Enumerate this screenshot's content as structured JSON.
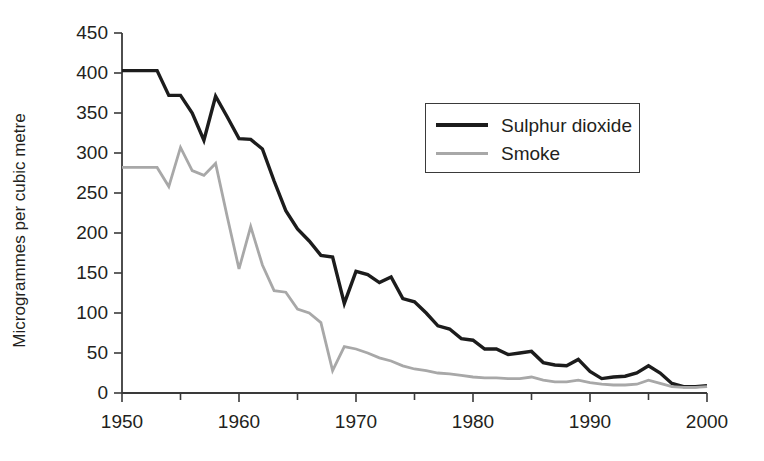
{
  "chart_data": {
    "type": "line",
    "title": "",
    "xlabel": "",
    "ylabel": "Microgrammes per cubic metre",
    "xlim": [
      1950,
      2000
    ],
    "ylim": [
      0,
      450
    ],
    "ytick_step": 50,
    "xtick_step": 10,
    "x_minor_step": 5,
    "grid": false,
    "legend_position": "upper-right-inside",
    "ytick_labels": [
      "0",
      "50",
      "100",
      "150",
      "200",
      "250",
      "300",
      "350",
      "400",
      "450"
    ],
    "ytick_values": [
      0,
      50,
      100,
      150,
      200,
      250,
      300,
      350,
      400,
      450
    ],
    "xtick_labels": [
      "1950",
      "1960",
      "1970",
      "1980",
      "1990",
      "2000"
    ],
    "xtick_values": [
      1950,
      1960,
      1970,
      1980,
      1990,
      2000
    ],
    "x": [
      1950,
      1951,
      1952,
      1953,
      1954,
      1955,
      1956,
      1957,
      1958,
      1959,
      1960,
      1961,
      1962,
      1963,
      1964,
      1965,
      1966,
      1967,
      1968,
      1969,
      1970,
      1971,
      1972,
      1973,
      1974,
      1975,
      1976,
      1977,
      1978,
      1979,
      1980,
      1981,
      1982,
      1983,
      1984,
      1985,
      1986,
      1987,
      1988,
      1989,
      1990,
      1991,
      1992,
      1993,
      1994,
      1995,
      1996,
      1997,
      1998,
      1999,
      2000
    ],
    "series": [
      {
        "name": "Sulphur dioxide",
        "color": "#1c1c1c",
        "linewidth": 3.4,
        "values": [
          403,
          403,
          403,
          403,
          372,
          372,
          350,
          316,
          371,
          345,
          318,
          317,
          305,
          265,
          228,
          205,
          190,
          172,
          170,
          112,
          152,
          148,
          138,
          145,
          118,
          114,
          100,
          84,
          80,
          68,
          66,
          55,
          55,
          48,
          50,
          52,
          38,
          35,
          34,
          42,
          27,
          18,
          20,
          21,
          25,
          34,
          25,
          12,
          8,
          8,
          9
        ]
      },
      {
        "name": "Smoke",
        "color": "#a8a8a8",
        "linewidth": 2.8,
        "values": [
          282,
          282,
          282,
          282,
          258,
          307,
          278,
          272,
          287,
          220,
          155,
          208,
          160,
          128,
          126,
          105,
          100,
          88,
          28,
          58,
          55,
          50,
          44,
          40,
          34,
          30,
          28,
          25,
          24,
          22,
          20,
          19,
          19,
          18,
          18,
          20,
          16,
          14,
          14,
          16,
          13,
          11,
          10,
          10,
          11,
          16,
          12,
          8,
          7,
          7,
          8
        ]
      }
    ]
  },
  "legend": {
    "items": [
      {
        "label": "Sulphur dioxide"
      },
      {
        "label": "Smoke"
      }
    ]
  }
}
